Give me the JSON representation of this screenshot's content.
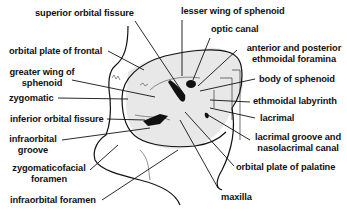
{
  "diagram": {
    "labels": {
      "superior_orbital_fissure": "superior orbital fissure",
      "lesser_wing_of_sphenoid": "lesser wing of sphenoid",
      "optic_canal": "optic canal",
      "orbital_plate_of_frontal": "orbital plate of frontal",
      "anterior_posterior_ethmoidal_foramina_1": "anterior and posterior",
      "anterior_posterior_ethmoidal_foramina_2": "ethmoidal foramina",
      "greater_wing_of_sphenoid_1": "greater wing of",
      "greater_wing_of_sphenoid_2": "sphenoid",
      "body_of_sphenoid": "body of sphenoid",
      "zygomatic": "zygomatic",
      "ethmoidal_labyrinth": "ethmoidal labyrinth",
      "inferior_orbital_fissure": "inferior orbital fissure",
      "lacrimal": "lacrimal",
      "infraorbital_groove_1": "infraorbital",
      "infraorbital_groove_2": "groove",
      "lacrimal_groove_1": "lacrimal groove and",
      "lacrimal_groove_2": "nasolacrimal canal",
      "orbital_plate_of_palatine": "orbital plate of palatine",
      "zygomaticofacial_foramen_1": "zygomaticofacial",
      "zygomaticofacial_foramen_2": "foramen",
      "maxilla": "maxilla",
      "infraorbital_foramen": "infraorbital foramen"
    },
    "colors": {
      "ink": "#111111",
      "shade": "#e6e6e6",
      "background": "#ffffff"
    }
  }
}
